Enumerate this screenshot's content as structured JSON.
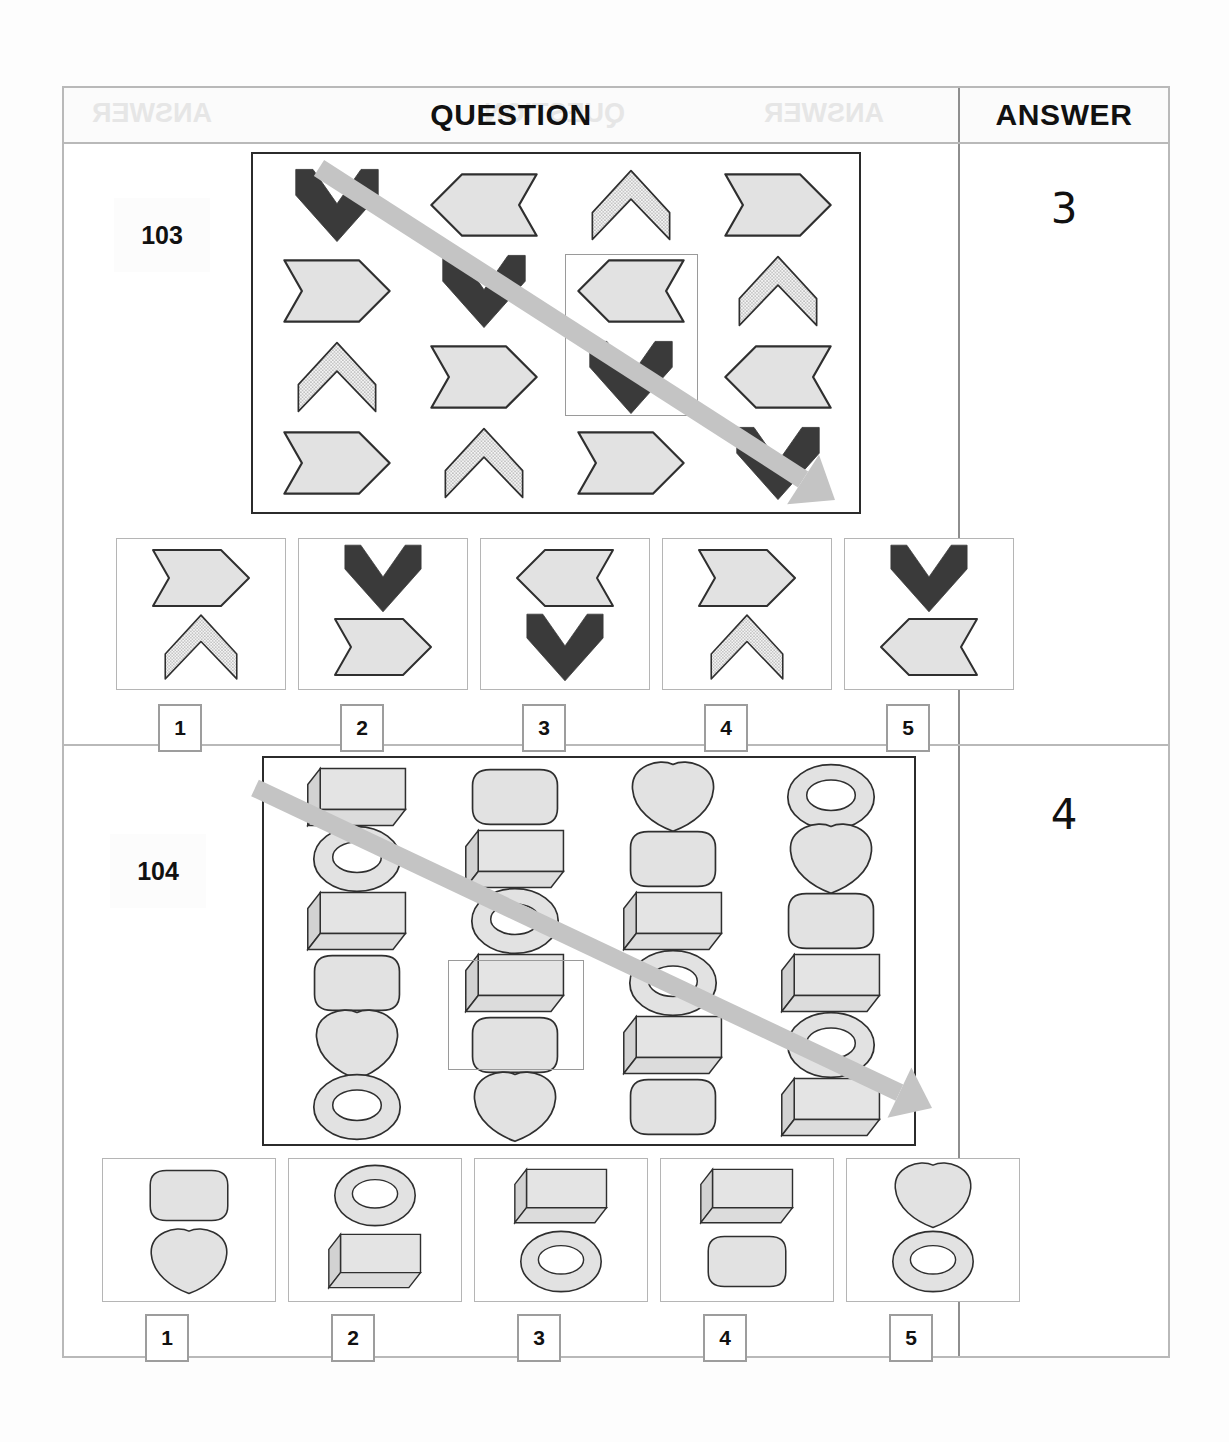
{
  "sheet": {
    "header": {
      "question_label": "QUESTION",
      "answer_label": "ANSWER",
      "ghost_left": "ANSWER",
      "ghost_mid": "QUESTION",
      "ghost_right": "ANSWER"
    }
  },
  "questions": [
    {
      "number": "103",
      "answer": "3",
      "matrix": {
        "cols": 4,
        "rows": 4,
        "shape_legend": {
          "chevron-down-dark": "dark down-pointing chevron",
          "banner-left-gray": "gray left-pointing banner",
          "chevron-up-dotted": "dotted up-pointing chevron",
          "banner-right-gray": "gray right-pointing banner"
        },
        "grid": [
          [
            "chevron-down-dark",
            "banner-left-gray",
            "chevron-up-dotted",
            "banner-right-gray"
          ],
          [
            "banner-right-gray",
            "chevron-down-dark",
            "banner-left-gray",
            "chevron-up-dotted"
          ],
          [
            "chevron-up-dotted",
            "banner-right-gray",
            "chevron-down-dark",
            "banner-left-gray"
          ],
          [
            "banner-right-gray",
            "chevron-up-dotted",
            "banner-right-gray",
            "chevron-down-dark"
          ]
        ],
        "highlighted_cells": [
          [
            1,
            2
          ],
          [
            2,
            2
          ]
        ]
      },
      "options": [
        {
          "label": "1",
          "top": "banner-right-gray",
          "bottom": "chevron-up-dotted"
        },
        {
          "label": "2",
          "top": "chevron-down-dark",
          "bottom": "banner-right-gray"
        },
        {
          "label": "3",
          "top": "banner-left-gray",
          "bottom": "chevron-down-dark"
        },
        {
          "label": "4",
          "top": "banner-right-gray",
          "bottom": "chevron-up-dotted"
        },
        {
          "label": "5",
          "top": "chevron-down-dark",
          "bottom": "banner-left-gray"
        }
      ]
    },
    {
      "number": "104",
      "answer": "4",
      "matrix": {
        "cols": 4,
        "rows": 6,
        "shape_legend": {
          "box-3d": "shaded 3D rectangular box",
          "rounded-rect": "gray rounded rectangle",
          "heart": "gray heart",
          "torus": "gray ring / torus"
        },
        "grid": [
          [
            "box-3d",
            "rounded-rect",
            "heart",
            "torus"
          ],
          [
            "torus",
            "box-3d",
            "rounded-rect",
            "heart"
          ],
          [
            "box-3d",
            "torus",
            "box-3d",
            "rounded-rect"
          ],
          [
            "rounded-rect",
            "box-3d",
            "torus",
            "box-3d"
          ],
          [
            "heart",
            "rounded-rect",
            "box-3d",
            "torus"
          ],
          [
            "torus",
            "heart",
            "rounded-rect",
            "box-3d"
          ]
        ],
        "highlighted_cells": [
          [
            3,
            1
          ],
          [
            4,
            1
          ]
        ]
      },
      "options": [
        {
          "label": "1",
          "top": "rounded-rect",
          "bottom": "heart"
        },
        {
          "label": "2",
          "top": "torus",
          "bottom": "box-3d"
        },
        {
          "label": "3",
          "top": "box-3d",
          "bottom": "torus"
        },
        {
          "label": "4",
          "top": "box-3d",
          "bottom": "rounded-rect"
        },
        {
          "label": "5",
          "top": "heart",
          "bottom": "torus"
        }
      ]
    }
  ],
  "colors": {
    "dark_shape": "#3a3a3a",
    "light_shape": "#e2e2e2",
    "dotted_shape": "#ededed",
    "outline": "#2f2f2f",
    "arrow": "#c4c4c4",
    "frame": "#b9b9b9",
    "page": "#fdfdfd"
  }
}
